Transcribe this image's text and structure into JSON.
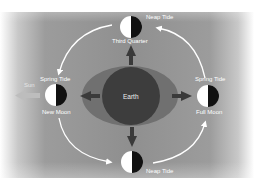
{
  "diagram": {
    "center": {
      "label": "Earth"
    },
    "sun": {
      "label": "Sun"
    },
    "moons": [
      {
        "id": "third-quarter",
        "phase_label": "Third Quarter",
        "tide_label": "Neap Tide"
      },
      {
        "id": "new-moon",
        "phase_label": "New Moon",
        "tide_label": "Spring Tide"
      },
      {
        "id": "full-moon",
        "phase_label": "Full Moon",
        "tide_label": "Spring Tide"
      },
      {
        "id": "first-quarter",
        "phase_label": "",
        "tide_label": "Neap Tide"
      }
    ],
    "colors": {
      "background": "#8f8f8f",
      "earth": "#3d3d3d",
      "tidal_bulge": "#707070",
      "moon_light": "#ffffff",
      "moon_dark": "#111111",
      "orbit_arrows": "#ffffff",
      "force_arrows": "#3a3a3a",
      "sun_arrow": "#b8b8b8"
    }
  }
}
